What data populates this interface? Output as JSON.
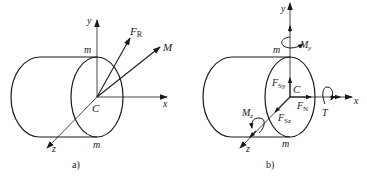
{
  "figure": {
    "panels": [
      {
        "id": "a",
        "caption": "a)",
        "origin_label": "C",
        "axes": {
          "x": "x",
          "y": "y",
          "z": "z"
        },
        "section_labels": [
          "m",
          "m"
        ],
        "vectors": [
          {
            "name": "F",
            "subscript": "R",
            "kind": "resultant-force"
          },
          {
            "name": "M",
            "subscript": "",
            "kind": "resultant-moment"
          }
        ]
      },
      {
        "id": "b",
        "caption": "b)",
        "origin_label": "C",
        "axes": {
          "x": "x",
          "y": "y",
          "z": "z"
        },
        "section_labels": [
          "m",
          "m"
        ],
        "vectors": [
          {
            "name": "F",
            "subscript": "Sy",
            "kind": "shear-force-y"
          },
          {
            "name": "F",
            "subscript": "Sz",
            "kind": "shear-force-z"
          },
          {
            "name": "F",
            "subscript": "N",
            "kind": "normal-force"
          },
          {
            "name": "M",
            "subscript": "y",
            "kind": "bending-moment-y"
          },
          {
            "name": "M",
            "subscript": "z",
            "kind": "bending-moment-z"
          },
          {
            "name": "T",
            "subscript": "",
            "kind": "torque"
          }
        ]
      }
    ],
    "stroke_color": "#1a1a1a",
    "background": "#ffffff"
  }
}
